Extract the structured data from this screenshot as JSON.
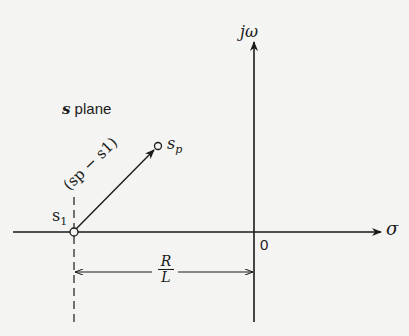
{
  "figure": {
    "plane_label_var": "s",
    "plane_label_text": " plane",
    "imag_axis_label": "jω",
    "real_axis_label": "σ",
    "origin_label": "0",
    "point_s1": {
      "base": "s",
      "sub": "1"
    },
    "point_sp": {
      "base": "s",
      "sub": "p"
    },
    "vector_label": "(sp − s1)",
    "distance_numerator": "R",
    "distance_denominator": "L"
  },
  "colors": {
    "ink": "#1a1a1a",
    "background": "#f4f4f2"
  }
}
